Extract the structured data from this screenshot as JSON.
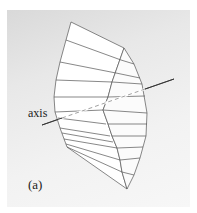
{
  "figure": {
    "panel_label": "(a)",
    "axis_label": "axis",
    "colors": {
      "background": "#e6e6e6",
      "faces": "#ffffff",
      "edges": "#555555",
      "axis": "#333333"
    }
  }
}
